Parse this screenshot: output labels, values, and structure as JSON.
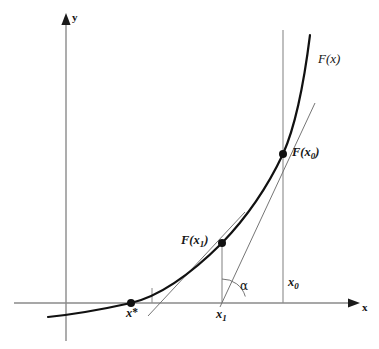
{
  "figure": {
    "kind": "newton-method-diagram",
    "width": 379,
    "height": 349,
    "background_color": "#ffffff"
  },
  "axes": {
    "x_label": "x",
    "y_label": "y",
    "x_axis_color": "#8a8a8a",
    "y_axis_color": "#8a8a8a",
    "origin_px": {
      "x": 66,
      "y": 303
    }
  },
  "curve": {
    "label": "F(x)",
    "color": "#111111",
    "stroke_width": 2.1
  },
  "points": [
    {
      "id": "root",
      "axis_label": "x*",
      "label_html": "x<span class=\"star\">*</span>",
      "marker": true,
      "px": {
        "x": 131,
        "y": 303
      }
    },
    {
      "id": "iterate-1",
      "curve_label": "F(x1)",
      "axis_label": "x1",
      "marker": true,
      "px": {
        "x": 222,
        "y": 243
      }
    },
    {
      "id": "iterate-0",
      "curve_label": "F(x0)",
      "axis_label": "x0",
      "marker": true,
      "px": {
        "x": 283,
        "y": 154
      }
    }
  ],
  "labels": {
    "curve_name": "F(x)",
    "f_x0": "F(x",
    "f_x0_sub": "0",
    "f_x0_close": ")",
    "f_x1": "F(x",
    "f_x1_sub": "1",
    "f_x1_close": ")",
    "x_star_base": "x",
    "x_star_mark": "*",
    "x0_base": "x",
    "x0_sub": "0",
    "x1_base": "x",
    "x1_sub": "1",
    "axis_x": "x",
    "axis_y": "y",
    "angle": "α"
  },
  "tangents": {
    "color": "#6e6e6e",
    "stroke_width": 0.9,
    "from_x0": {
      "start": {
        "x": 222,
        "y": 303
      },
      "end": {
        "x": 313,
        "y": 108
      }
    },
    "from_x1": {
      "start": {
        "x": 152,
        "y": 313
      },
      "end": {
        "x": 243,
        "y": 215
      }
    }
  },
  "drop_lines": {
    "color": "#8a8a8a",
    "at_x0": {
      "x": 283,
      "top": 30,
      "bottom": 303
    },
    "at_x1": {
      "x": 222,
      "top": 243,
      "bottom": 303
    },
    "at_root_tick": {
      "x": 152,
      "top": 288,
      "bottom": 303
    }
  },
  "angle_arc": {
    "symbol": "α",
    "vertex_px": {
      "x": 222,
      "y": 303
    },
    "radius_px": 24,
    "color": "#6e6e6e"
  }
}
